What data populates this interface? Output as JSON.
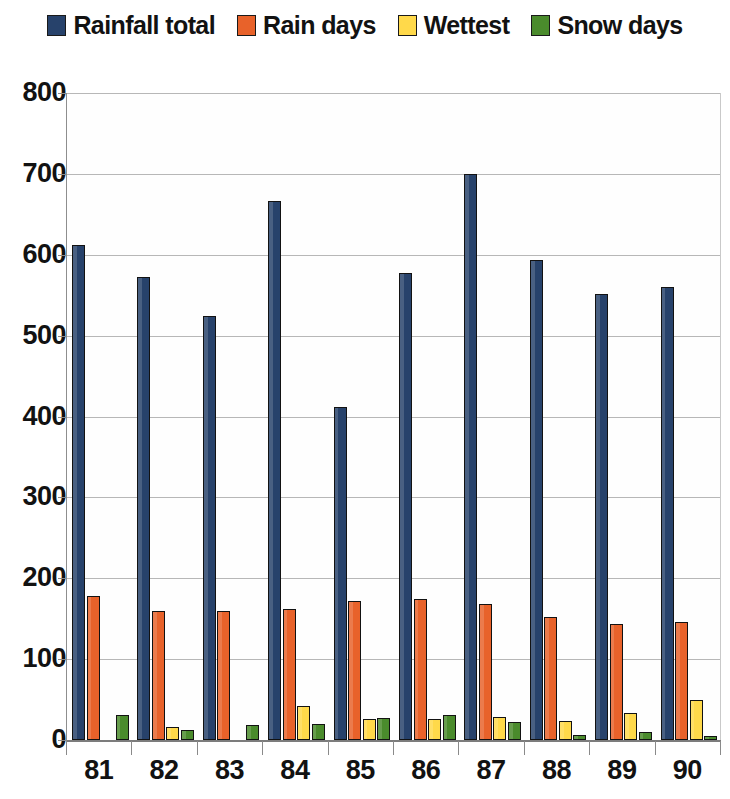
{
  "legend": {
    "position": "top-center",
    "entries": [
      {
        "label": "Rainfall total",
        "color": "#27426B"
      },
      {
        "label": "Rain days",
        "color": "#E8622A"
      },
      {
        "label": "Wettest",
        "color": "#FFD94A"
      },
      {
        "label": "Snow days",
        "color": "#4A8B2C"
      }
    ]
  },
  "axes": {
    "y_ticks": [
      "800",
      "700",
      "600",
      "500",
      "400",
      "300",
      "200",
      "100",
      "0"
    ],
    "x_ticks": [
      "81",
      "82",
      "83",
      "84",
      "85",
      "86",
      "87",
      "88",
      "89",
      "90"
    ]
  },
  "chart_data": {
    "type": "bar",
    "title": "",
    "subtitle": "",
    "xlabel": "",
    "ylabel": "",
    "ylim": [
      0,
      800
    ],
    "ytick_step": 100,
    "grid": true,
    "legend_position": "top-center",
    "categories": [
      "81",
      "82",
      "83",
      "84",
      "85",
      "86",
      "87",
      "88",
      "89",
      "90"
    ],
    "series": [
      {
        "name": "Rainfall total",
        "color": "#27426B",
        "values": [
          612,
          572,
          524,
          666,
          412,
          578,
          700,
          594,
          551,
          560
        ]
      },
      {
        "name": "Rain days",
        "color": "#E8622A",
        "values": [
          178,
          159,
          159,
          162,
          172,
          174,
          168,
          152,
          143,
          146
        ]
      },
      {
        "name": "Wettest",
        "color": "#FFD94A",
        "values": [
          0,
          16,
          0,
          42,
          26,
          26,
          28,
          24,
          33,
          50
        ]
      },
      {
        "name": "Snow days",
        "color": "#4A8B2C",
        "values": [
          31,
          13,
          18,
          20,
          27,
          31,
          22,
          6,
          10,
          5
        ]
      }
    ]
  }
}
